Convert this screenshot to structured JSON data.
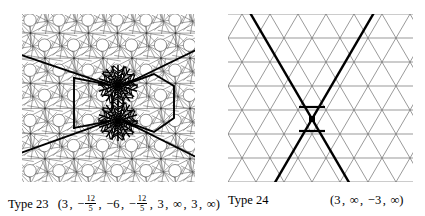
{
  "figures": {
    "left": {
      "name": "pentagonal-quasiperiodic-tiling",
      "description": "dense 5-fold pentagonal tiling with circular voids and bold overlay lines",
      "style": {
        "lattice_color": "#5a5a5a",
        "bold_color": "#000000",
        "disk_color": "#ffffff",
        "background": "#ffffff"
      },
      "geometry": {
        "cell": 29,
        "disk_radius": 6.2,
        "lattice_stroke": 0.55,
        "bold_stroke": 1.9
      },
      "burst_centers": [
        [
          96,
          71
        ],
        [
          96,
          107
        ]
      ],
      "burst_spokes": 20,
      "burst_outer_radius": 20,
      "burst_inner_radius": 6
    },
    "right": {
      "name": "triangular-lattice",
      "description": "triangular lattice with two bold crossing lines meeting at a marked node",
      "style": {
        "lattice_color": "#6e6e6e",
        "bold_color": "#000000",
        "background": "#ffffff"
      },
      "geometry": {
        "h_spacing": 28,
        "v_spacing": 24,
        "lattice_stroke": 0.7,
        "bold_stroke": 2.4
      },
      "crossing_point": [
        84,
        105
      ],
      "node_marker_size": 6
    }
  },
  "captions": {
    "left": {
      "label": "Type 23",
      "open": "(",
      "close": ")",
      "terms": [
        "3",
        "−",
        "−6",
        "−",
        "3",
        "∞",
        "3",
        "∞"
      ],
      "fractions": [
        "12/5",
        "12/5"
      ],
      "frac_numerator": "12",
      "frac_denominator": "5",
      "term1": "3",
      "term2_sign": "−",
      "term3": "−6",
      "term4_sign": "−",
      "term5": "3",
      "term6": "∞",
      "term7": "3",
      "term8": "∞",
      "separator": ",",
      "full_text": "Type 23 (3 , − 12/5 , −6 , − 12/5 , 3 , ∞ , 3 , ∞)"
    },
    "right": {
      "label": "Type 24",
      "open": "(",
      "close": ")",
      "term1": "3",
      "term2": "∞",
      "term3": "−3",
      "term4": "∞",
      "separator": ",",
      "full_text": "Type 24 (3 , ∞ , −3 , ∞)"
    }
  }
}
